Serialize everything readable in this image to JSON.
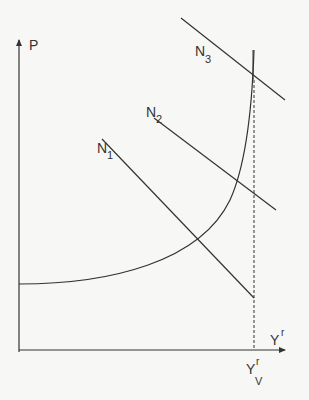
{
  "diagram": {
    "type": "economics-supply-demand",
    "axes": {
      "y_label": "P",
      "x_label": "Y",
      "x_label_superscript": "r"
    },
    "labels": {
      "n1": {
        "main": "N",
        "sub": "1"
      },
      "n2": {
        "main": "N",
        "sub": "2"
      },
      "n3": {
        "main": "N",
        "sub": "3"
      },
      "yv": {
        "main": "Y",
        "sup": "r",
        "sub": "V"
      }
    },
    "lines": {
      "n1": {
        "x1": 102,
        "y1": 139,
        "x2": 254,
        "y2": 298
      },
      "n2": {
        "x1": 154,
        "y1": 118,
        "x2": 276,
        "y2": 210
      },
      "n3": {
        "x1": 181,
        "y1": 18,
        "x2": 285,
        "y2": 100
      }
    },
    "vertical_limit": {
      "x": 254,
      "top": 50,
      "bottom": 350,
      "style": "dashed"
    },
    "supply_curve": "M 19 284 C 110 284, 200 262, 230 200 C 246 165, 252 110, 254 50",
    "colors": {
      "line": "#333333",
      "background": "#f7f7f5"
    }
  }
}
